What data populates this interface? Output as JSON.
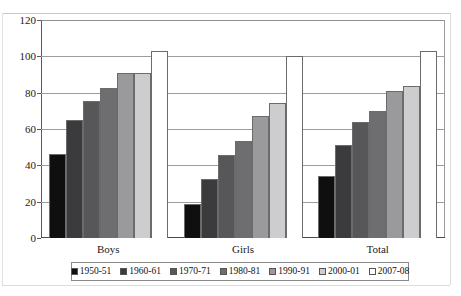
{
  "chart_data": {
    "type": "bar",
    "title": "",
    "subtitle": "",
    "xlabel": "",
    "ylabel": "",
    "ylim": [
      0,
      120
    ],
    "ytick_step": 20,
    "yticks": [
      0,
      20,
      40,
      60,
      80,
      100,
      120
    ],
    "grid": true,
    "grid_axis": "y",
    "legend_position": "bottom",
    "categories": [
      "Boys",
      "Girls",
      "Total"
    ],
    "series": [
      {
        "name": "1950-51",
        "color": "#100f10",
        "values": [
          46.4,
          18.7,
          33.9
        ]
      },
      {
        "name": "1960-61",
        "color": "#3b3a3c",
        "values": [
          65.2,
          32.6,
          51.0
        ]
      },
      {
        "name": "1970-71",
        "color": "#575658",
        "values": [
          75.5,
          45.7,
          63.9
        ]
      },
      {
        "name": "1980-81",
        "color": "#6e6d6f",
        "values": [
          82.6,
          53.6,
          69.7
        ]
      },
      {
        "name": "1990-91",
        "color": "#9a999b",
        "values": [
          90.9,
          67.2,
          81.0
        ]
      },
      {
        "name": "2000-01",
        "color": "#cdccce",
        "values": [
          90.9,
          74.1,
          83.9
        ]
      },
      {
        "name": "2007-08",
        "color": "#ffffff",
        "values": [
          103.0,
          100.0,
          103.0
        ]
      }
    ]
  },
  "axis": {
    "ytick_labels": [
      "120",
      "100",
      "80",
      "60",
      "40",
      "20",
      "0"
    ]
  },
  "legend": {
    "items": [
      {
        "label": "1950-51",
        "color": "#100f10"
      },
      {
        "label": "1960-61",
        "color": "#3b3a3c"
      },
      {
        "label": "1970-71",
        "color": "#575658"
      },
      {
        "label": "1980-81",
        "color": "#6e6d6f"
      },
      {
        "label": "1990-91",
        "color": "#9a999b"
      },
      {
        "label": "2000-01",
        "color": "#cdccce"
      },
      {
        "label": "2007-08",
        "color": "#ffffff"
      }
    ]
  }
}
